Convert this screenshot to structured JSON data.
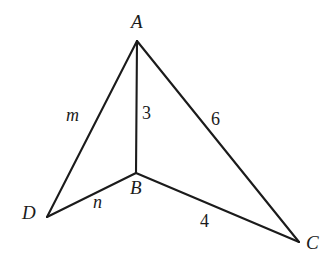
{
  "figure": {
    "type": "geometry-diagram",
    "background_color": "#ffffff",
    "stroke_color": "#1b1b1b",
    "stroke_width": 2.1,
    "width": 336,
    "height": 268
  },
  "vertices": [
    {
      "id": "A",
      "label": "A",
      "x": 137,
      "y": 41,
      "label_x": 131,
      "label_y": 12
    },
    {
      "id": "B",
      "label": "B",
      "x": 136,
      "y": 173,
      "label_x": 130,
      "label_y": 178
    },
    {
      "id": "C",
      "label": "C",
      "x": 299,
      "y": 242,
      "label_x": 306,
      "label_y": 233
    },
    {
      "id": "D",
      "label": "D",
      "x": 47,
      "y": 217,
      "label_x": 22,
      "label_y": 203
    }
  ],
  "edges": [
    {
      "id": "AD",
      "from": "A",
      "to": "D",
      "label": "m",
      "label_style": "italic",
      "label_x": 66,
      "label_y": 106
    },
    {
      "id": "AB",
      "from": "A",
      "to": "B",
      "label": "3",
      "label_style": "normal",
      "label_x": 142,
      "label_y": 104
    },
    {
      "id": "AC",
      "from": "A",
      "to": "C",
      "label": "6",
      "label_style": "normal",
      "label_x": 211,
      "label_y": 110
    },
    {
      "id": "DB",
      "from": "D",
      "to": "B",
      "label": "n",
      "label_style": "italic",
      "label_x": 93,
      "label_y": 193
    },
    {
      "id": "BC",
      "from": "B",
      "to": "C",
      "label": "4",
      "label_style": "normal",
      "label_x": 200,
      "label_y": 212
    }
  ],
  "chart_data": {
    "type": "diagram",
    "title": "",
    "points": {
      "A": [
        137,
        41
      ],
      "B": [
        136,
        173
      ],
      "C": [
        299,
        242
      ],
      "D": [
        47,
        217
      ]
    },
    "segments": [
      {
        "endpoints": [
          "A",
          "D"
        ],
        "length_label": "m"
      },
      {
        "endpoints": [
          "A",
          "B"
        ],
        "length_label": "3"
      },
      {
        "endpoints": [
          "A",
          "C"
        ],
        "length_label": "6"
      },
      {
        "endpoints": [
          "D",
          "B"
        ],
        "length_label": "n"
      },
      {
        "endpoints": [
          "B",
          "C"
        ],
        "length_label": "4"
      }
    ]
  }
}
